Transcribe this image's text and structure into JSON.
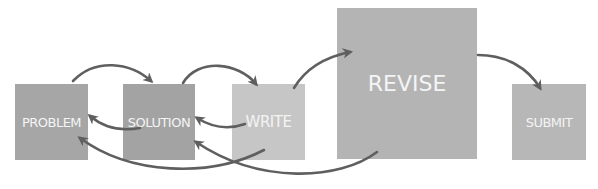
{
  "diagram": {
    "type": "process-flow",
    "nodes": [
      {
        "id": "problem",
        "label": "PROBLEM",
        "color": "#a6a6a6"
      },
      {
        "id": "solution",
        "label": "SOLUTION",
        "color": "#a3a3a3"
      },
      {
        "id": "write",
        "label": "WRITE",
        "color": "#c6c6c6"
      },
      {
        "id": "revise",
        "label": "REVISE",
        "color": "#b4b4b4"
      },
      {
        "id": "submit",
        "label": "SUBMIT",
        "color": "#b7b7b7"
      }
    ],
    "edges": [
      {
        "from": "problem",
        "to": "solution",
        "direction": "forward"
      },
      {
        "from": "solution",
        "to": "write",
        "direction": "forward"
      },
      {
        "from": "write",
        "to": "revise",
        "direction": "forward"
      },
      {
        "from": "revise",
        "to": "submit",
        "direction": "forward"
      },
      {
        "from": "solution",
        "to": "problem",
        "direction": "back"
      },
      {
        "from": "write",
        "to": "solution",
        "direction": "back"
      },
      {
        "from": "write",
        "to": "problem",
        "direction": "back"
      },
      {
        "from": "revise",
        "to": "solution",
        "direction": "back"
      }
    ],
    "arrow_color": "#5f5f5f"
  }
}
